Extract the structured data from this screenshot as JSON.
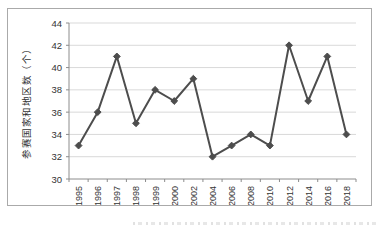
{
  "chart_data": {
    "type": "line",
    "title": "",
    "xlabel": "",
    "ylabel": "参赛国家和地区数（个）",
    "categories": [
      "1995",
      "1996",
      "1997",
      "1998",
      "1999",
      "2000",
      "2002",
      "2004",
      "2006",
      "2008",
      "2010",
      "2012",
      "2014",
      "2016",
      "2018"
    ],
    "values": [
      33,
      36,
      41,
      35,
      38,
      37,
      39,
      32,
      33,
      34,
      33,
      42,
      37,
      41,
      34
    ],
    "ylim": [
      30,
      44
    ],
    "yticks": [
      30,
      32,
      34,
      36,
      38,
      40,
      42,
      44
    ],
    "grid": true,
    "legend_position": "none",
    "marker": "diamond",
    "colors": {
      "line": "#4d4d4d",
      "marker": "#4d4d4d",
      "gridline": "#d9d9d9",
      "axis": "#8c8c8c",
      "tick_text": "#333333",
      "axis_title_text": "#333333",
      "frame_border": "#aaaaaa",
      "background": "#ffffff"
    }
  }
}
